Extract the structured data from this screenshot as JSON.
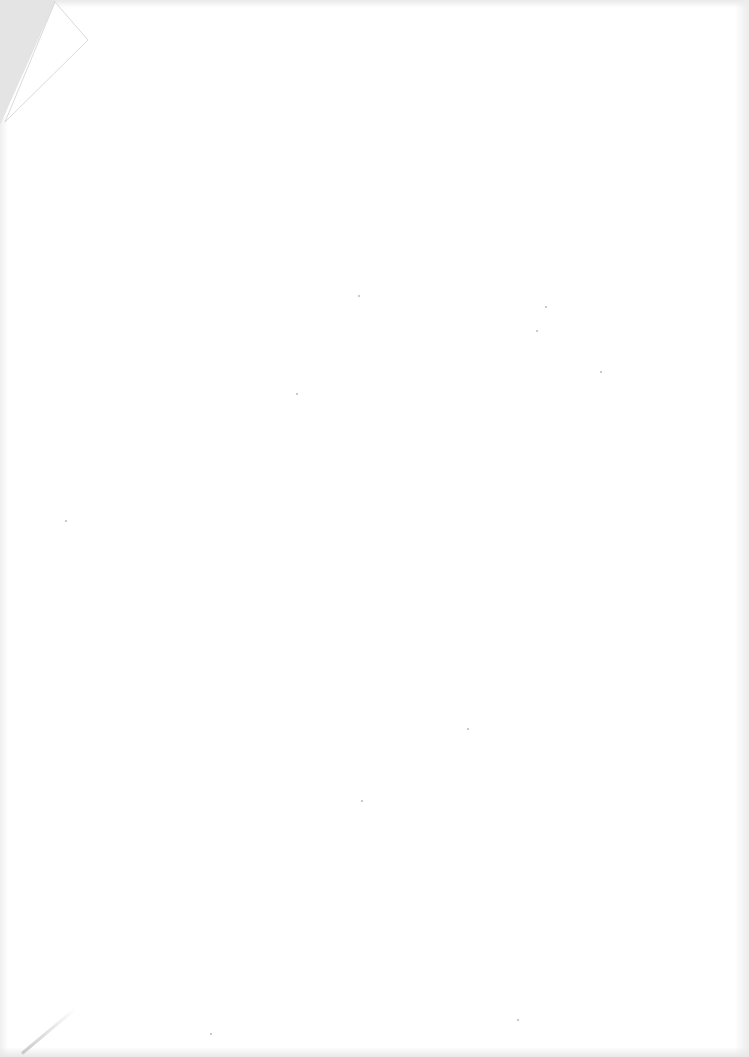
{
  "document": {
    "type": "scanned-page",
    "content": "",
    "description": "Blank paper page with folded top-left corner"
  },
  "colors": {
    "paper": "#ffffff",
    "shadow": "#e4e4e4",
    "speckle": "#b8b8b8"
  }
}
